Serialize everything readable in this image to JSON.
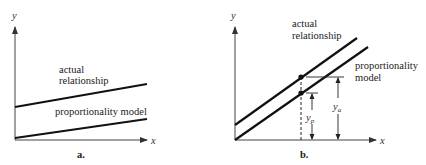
{
  "panel_a": {
    "caption": "a.",
    "x_axis_label": "x",
    "y_axis_label": "y",
    "line_actual_label_1": "actual",
    "line_actual_label_2": "relationship",
    "line_model_label": "proportionality model"
  },
  "panel_b": {
    "caption": "b.",
    "x_axis_label": "x",
    "y_axis_label": "y",
    "line_actual_label_1": "actual",
    "line_actual_label_2": "relationship",
    "line_model_label_1": "proportionality",
    "line_model_label_2": "model",
    "yp_label": "y",
    "yp_sub": "p",
    "ya_label": "y",
    "ya_sub": "a"
  },
  "colors": {
    "line": "#111111",
    "axis": "#333333",
    "background": "#ffffff"
  }
}
